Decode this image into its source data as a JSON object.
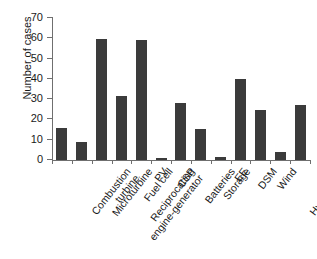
{
  "chart_data": {
    "type": "bar",
    "title": "",
    "subtitle": "",
    "xlabel": "",
    "ylabel": "Number of cases",
    "ylim": [
      0,
      70
    ],
    "ytick_step": 10,
    "yticks": [
      70,
      60,
      50,
      40,
      30,
      20,
      10,
      0
    ],
    "ytick_labels": [
      "70",
      "60",
      "50",
      "40",
      "30",
      "20",
      "10",
      "0"
    ],
    "grid": false,
    "legend": false,
    "legend_position": "none",
    "bar_color": "#3b3b3b",
    "axis_color": "#6f6f6f",
    "background_color": "#ffffff",
    "categories": [
      "Combustion turbine",
      "Microturbine",
      "Reciprocating engine-generator",
      "Fuel cell",
      "PV",
      "CSP",
      "Batteries",
      "Storage",
      "EE",
      "DSM",
      "Wind",
      "Hydropower",
      "Other"
    ],
    "category_label_lines": [
      [
        "Combustion",
        "turbine"
      ],
      [
        "Microturbine"
      ],
      [
        "Reciprocating",
        "engine-generator"
      ],
      [
        "Fuel cell"
      ],
      [
        "PV"
      ],
      [
        "CSP"
      ],
      [
        "Batteries"
      ],
      [
        "Storage"
      ],
      [
        "EE"
      ],
      [
        "DSM"
      ],
      [
        "Wind"
      ],
      [
        "Hydropower"
      ],
      [
        "Other"
      ]
    ],
    "values": [
      16,
      9,
      59.5,
      31.5,
      59,
      1,
      28,
      15.5,
      1.5,
      40,
      24.5,
      4,
      27
    ]
  }
}
